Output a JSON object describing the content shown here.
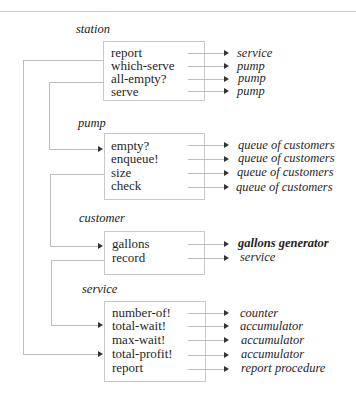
{
  "diagram": {
    "objects": [
      {
        "name": "station",
        "messages": [
          {
            "label": "report",
            "target": "service"
          },
          {
            "label": "which-serve",
            "target": "pump"
          },
          {
            "label": "all-empty?",
            "target": "pump"
          },
          {
            "label": "serve",
            "target": "pump"
          }
        ]
      },
      {
        "name": "pump",
        "messages": [
          {
            "label": "empty?",
            "target": "queue of customers"
          },
          {
            "label": "enqueue!",
            "target": "queue of customers"
          },
          {
            "label": "size",
            "target": "queue of customers"
          },
          {
            "label": "check",
            "target": "queue of customers"
          }
        ]
      },
      {
        "name": "customer",
        "messages": [
          {
            "label": "gallons",
            "target": "gallons generator"
          },
          {
            "label": "record",
            "target": "service"
          }
        ]
      },
      {
        "name": "service",
        "messages": [
          {
            "label": "number-of!",
            "target": "counter"
          },
          {
            "label": "total-wait!",
            "target": "accumulator"
          },
          {
            "label": "max-wait!",
            "target": "accumulator"
          },
          {
            "label": "total-profit!",
            "target": "accumulator"
          },
          {
            "label": "report",
            "target": "report procedure"
          }
        ]
      }
    ],
    "connectors": [
      {
        "from": "station.report",
        "to": "service.total-profit!"
      },
      {
        "from": "station.all-empty?",
        "to": "pump.empty?"
      },
      {
        "from": "pump.size",
        "to": "customer.gallons"
      },
      {
        "from": "customer.record",
        "to": "service.total-wait!"
      }
    ],
    "colors": {
      "line": "#bdbdbd",
      "box_border": "#c9c9c9",
      "text": "#1f1f1f"
    }
  }
}
